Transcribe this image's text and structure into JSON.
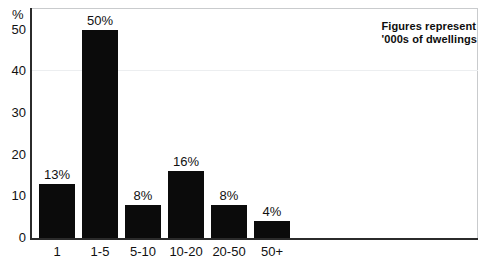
{
  "chart_data": {
    "type": "bar",
    "title": "",
    "subtitle": "",
    "xlabel": "",
    "ylabel": "%",
    "categories": [
      "1",
      "1-5",
      "5-10",
      "10-20",
      "20-50",
      "50+"
    ],
    "values": [
      13,
      50,
      8,
      16,
      8,
      4
    ],
    "data_labels": [
      "13%",
      "50%",
      "8%",
      "16%",
      "8%",
      "4%"
    ],
    "ylim": [
      0,
      55
    ],
    "yticks": [
      0,
      10,
      20,
      30,
      40,
      50
    ],
    "ytick_labels": [
      "0",
      "10",
      "20",
      "30",
      "40",
      "50"
    ],
    "grid": false,
    "legend": null,
    "annotations": [
      "Figures represent",
      "'000s of dwellings"
    ],
    "series": [
      {
        "name": "Share of dwellings",
        "values": [
          13,
          50,
          8,
          16,
          8,
          4
        ],
        "color": "#0b0b0b"
      }
    ],
    "colors": {
      "bar": "#0b0b0b",
      "axis": "#2b2b2b",
      "frame": "#c9cbcd",
      "text": "#111111",
      "background": "#ffffff"
    }
  },
  "axis": {
    "unit_label": "%"
  }
}
